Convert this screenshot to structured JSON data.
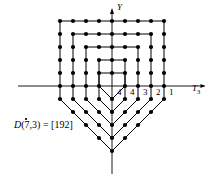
{
  "figure": {
    "title_caption": "D(7,3) = [192]",
    "caption_parts": {
      "symbol": "D",
      "args": "(7,3)",
      "equals": "= [192]"
    },
    "axes": {
      "x_label": "T",
      "x_label_sub": "3",
      "y_label": "Y",
      "x_axis_y_px": 86,
      "y_axis_x_px": 112,
      "x_axis_from_px": 18,
      "x_axis_to_px": 205,
      "y_axis_from_px": 10,
      "y_axis_to_px": 174
    },
    "x_tick_labels": [
      {
        "text": "4",
        "x": 117,
        "y": 88
      },
      {
        "text": "4",
        "x": 130,
        "y": 88
      },
      {
        "text": "3",
        "x": 143,
        "y": 88
      },
      {
        "text": "2",
        "x": 156,
        "y": 88
      },
      {
        "text": "1",
        "x": 169,
        "y": 88
      }
    ],
    "colors": {
      "stroke": "#000000",
      "dot_fill": "#000000",
      "background": "#ffffff"
    },
    "geometry": {
      "origin_x": 112,
      "origin_y": 86,
      "step_x": 13.0,
      "step_y": 13.0,
      "n_rings": 5,
      "description": "Five nested hexagonal contours with flat top, slanted upper sides, vertical sides, and a V-shaped bottom apex on the Y axis."
    },
    "rings": [
      {
        "index": 1,
        "half_width": 4,
        "top_row": 5,
        "top_flat_half": 4,
        "shoulder_drop": 1,
        "bottom_apex_row": -5
      },
      {
        "index": 2,
        "half_width": 3,
        "top_row": 4,
        "top_flat_half": 3,
        "shoulder_drop": 1,
        "bottom_apex_row": -4
      },
      {
        "index": 3,
        "half_width": 2,
        "top_row": 3,
        "top_flat_half": 2,
        "shoulder_drop": 1,
        "bottom_apex_row": -3
      },
      {
        "index": 4,
        "half_width": 1,
        "top_row": 2,
        "top_flat_half": 1,
        "shoulder_drop": 1,
        "bottom_apex_row": -2
      },
      {
        "index": 5,
        "half_width": 1,
        "top_row": 1,
        "top_flat_half": 1,
        "shoulder_drop": 0,
        "bottom_apex_row": -1
      }
    ],
    "dot_radius_px": 2.1,
    "line_width_px": 1.0
  }
}
